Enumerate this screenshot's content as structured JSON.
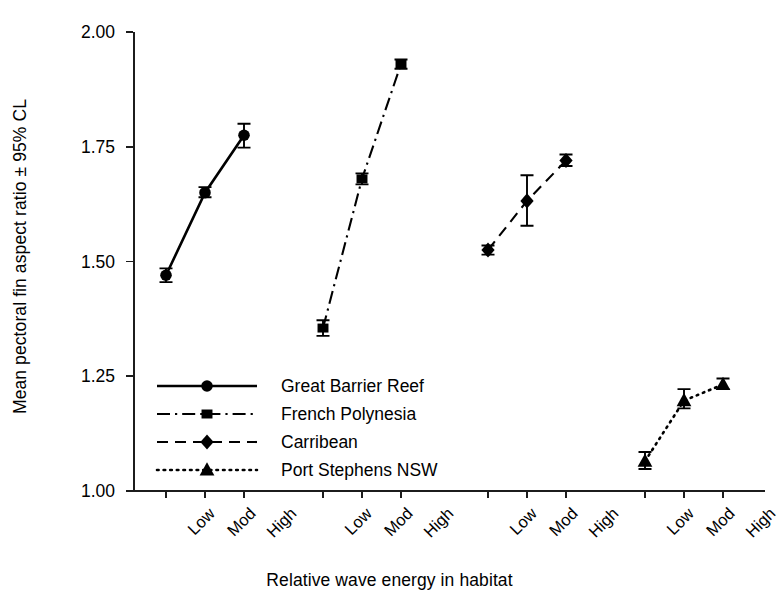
{
  "chart_data": {
    "type": "line",
    "title": "",
    "xlabel": "Relative wave energy in habitat",
    "ylabel": "Mean pectoral fin aspect ratio ± 95% CL",
    "ylim": [
      1.0,
      2.0
    ],
    "yticks": [
      1.0,
      1.25,
      1.5,
      1.75,
      2.0
    ],
    "ytick_labels": [
      "1.00",
      "1.25",
      "1.50",
      "1.75",
      "2.00"
    ],
    "categories": [
      "Low",
      "Mod",
      "High"
    ],
    "grid": false,
    "legend_position": "inside-lower-left",
    "groups": [
      "Great Barrier Reef",
      "French Polynesia",
      "Carribean",
      "Port Stephens NSW"
    ],
    "series": [
      {
        "name": "Great Barrier Reef",
        "marker": "circle",
        "linestyle": "solid",
        "color": "#000000",
        "x": [
          "Low",
          "Mod",
          "High"
        ],
        "values": [
          1.47,
          1.65,
          1.775
        ],
        "ci_lower": [
          1.455,
          1.64,
          1.748
        ],
        "ci_upper": [
          1.485,
          1.662,
          1.8
        ]
      },
      {
        "name": "French Polynesia",
        "marker": "square",
        "linestyle": "dashdot",
        "color": "#000000",
        "x": [
          "Low",
          "Mod",
          "High"
        ],
        "values": [
          1.355,
          1.68,
          1.93
        ],
        "ci_lower": [
          1.338,
          1.668,
          1.92
        ],
        "ci_upper": [
          1.372,
          1.692,
          1.94
        ]
      },
      {
        "name": "Carribean",
        "marker": "diamond",
        "linestyle": "dashed",
        "color": "#000000",
        "x": [
          "Low",
          "Mod",
          "High"
        ],
        "values": [
          1.525,
          1.632,
          1.72
        ],
        "ci_lower": [
          1.515,
          1.578,
          1.708
        ],
        "ci_upper": [
          1.535,
          1.688,
          1.733
        ]
      },
      {
        "name": "Port Stephens NSW",
        "marker": "triangle",
        "linestyle": "dotted",
        "color": "#000000",
        "x": [
          "Low",
          "Mod",
          "High"
        ],
        "values": [
          1.065,
          1.197,
          1.232
        ],
        "ci_lower": [
          1.048,
          1.18,
          1.222
        ],
        "ci_upper": [
          1.085,
          1.222,
          1.245
        ]
      }
    ]
  },
  "axes": {
    "y_title": "Mean pectoral fin aspect ratio ± 95% CL",
    "x_title": "Relative wave energy in habitat",
    "y_tick_labels": [
      "2.00",
      "1.75",
      "1.50",
      "1.25",
      "1.00"
    ],
    "x_tick_labels": [
      "Low",
      "Mod",
      "High",
      "Low",
      "Mod",
      "High",
      "Low",
      "Mod",
      "High",
      "Low",
      "Mod",
      "High"
    ]
  },
  "legend": {
    "entries": [
      {
        "label": "Great Barrier Reef",
        "marker": "circle-marker",
        "line": "solid-line"
      },
      {
        "label": "French Polynesia",
        "marker": "square-marker",
        "line": "dash-dot-line"
      },
      {
        "label": "Carribean",
        "marker": "diamond-marker",
        "line": "dashed-line"
      },
      {
        "label": "Port Stephens NSW",
        "marker": "triangle-marker",
        "line": "dotted-line"
      }
    ]
  },
  "colors": {
    "ink": "#000000",
    "axis": "#1c1c1c",
    "background": "#ffffff"
  }
}
